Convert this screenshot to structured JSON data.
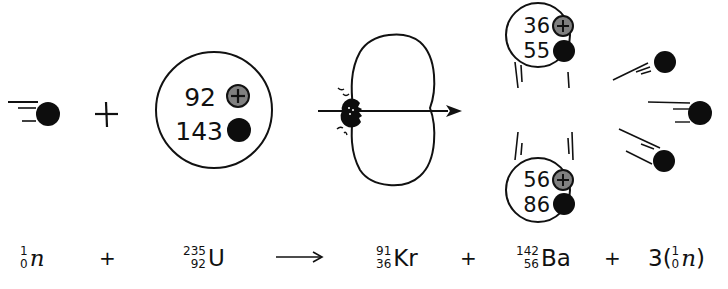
{
  "colors": {
    "ink": "#111111",
    "proton_fill": "#808080",
    "neutron_fill": "#0d0d0d",
    "background": "#ffffff"
  },
  "diagram": {
    "incoming_neutron": {
      "icon": "neutron-icon"
    },
    "plus_sign": "+",
    "uranium_nucleus": {
      "protons": "92",
      "neutrons": "143"
    },
    "fission_stage": {
      "icon": "splitting-nucleus-icon"
    },
    "krypton_fragment": {
      "protons": "36",
      "neutrons": "55"
    },
    "barium_fragment": {
      "protons": "56",
      "neutrons": "86"
    },
    "released_neutrons": {
      "count": 3,
      "icon": "neutron-icon"
    }
  },
  "equation": {
    "neutron_in": {
      "mass": "1",
      "atomic": "0",
      "symbol": "n"
    },
    "plus1": "+",
    "uranium": {
      "mass": "235",
      "atomic": "92",
      "symbol": "U"
    },
    "arrow": "→",
    "krypton": {
      "mass": "91",
      "atomic": "36",
      "symbol": "Kr"
    },
    "plus2": "+",
    "barium": {
      "mass": "142",
      "atomic": "56",
      "symbol": "Ba"
    },
    "plus3": "+",
    "neutrons_out": {
      "coefficient": "3(",
      "mass": "1",
      "atomic": "0",
      "symbol": "n",
      "close": ")"
    }
  }
}
